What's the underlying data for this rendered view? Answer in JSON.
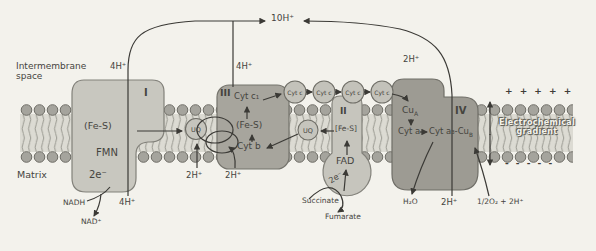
{
  "figure": {
    "regions": {
      "intermembrane_line1": "Intermembrane",
      "intermembrane_line2": "space",
      "matrix": "Matrix"
    },
    "proton_labels": {
      "total_top": "10H⁺",
      "complex_i_top": "4H⁺",
      "complex_iii_top": "4H⁺",
      "complex_iv_top": "2H⁺",
      "complex_i_bottom": "4H⁺",
      "uq_left": "2H⁺",
      "uq_right": "2H⁺",
      "complex_iv_bottom": "2H⁺"
    },
    "complex_i": {
      "numeral": "I",
      "fe_s": "(Fe-S)",
      "fmn": "FMN",
      "electrons": "2e⁻",
      "substrate": "NADH",
      "product": "NAD⁺"
    },
    "complex_ii": {
      "numeral": "II",
      "fe_s": "[Fe-S]",
      "fad": "FAD",
      "electrons": "2e⁻",
      "substrate": "Succinate",
      "product": "Fumarate"
    },
    "complex_iii": {
      "numeral": "III",
      "cyt_c1": "Cyt c₁",
      "fe_s": "(Fe-S)",
      "cyt_b": "Cyt b"
    },
    "complex_iv": {
      "numeral": "IV",
      "cu_a_base": "Cu",
      "cu_a_sub": "A",
      "cyt_a": "Cyt a",
      "cyt_a3": "Cyt a₃-",
      "cu_b_base": "Cu",
      "cu_b_sub": "B",
      "water": "H₂O",
      "oxygen_in": "1/2O₂ + 2H⁺"
    },
    "carriers": {
      "ubiquinone": "UQ",
      "cytochrome_c": "Cyt c"
    },
    "gradient": {
      "plus_row": "+ + + + +",
      "minus_row": "- - - - -",
      "label_line1": "Electrochemical",
      "label_line2": "gradient"
    },
    "colors": {
      "background": "#f3f2ec",
      "complex_light": "#c8c7bf",
      "complex_dark": "#a19f97",
      "complex_iv_fill": "#9d9b93",
      "membrane_head": "#a5a49d",
      "membrane_tails_bg": "#dcdbd3",
      "line": "#3b3a36"
    }
  }
}
